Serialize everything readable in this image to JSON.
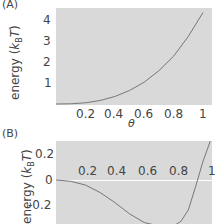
{
  "chart_data": [
    {
      "panel": "(A)",
      "type": "line",
      "xlabel": "θ",
      "ylabel": "energy (kBT)",
      "ylabel_parts": {
        "pre": "energy (",
        "k": "k",
        "sub": "B",
        "T": "T",
        "post": ")"
      },
      "xticks": [
        "0.2",
        "0.4",
        "0.6",
        "0.8",
        "1"
      ],
      "yticks": [
        "1",
        "2",
        "3",
        "4"
      ],
      "xlim": [
        0,
        1.05
      ],
      "ylim": [
        0,
        4.6
      ],
      "x": [
        0,
        0.1,
        0.2,
        0.3,
        0.4,
        0.5,
        0.6,
        0.7,
        0.8,
        0.9,
        1.0
      ],
      "y": [
        0,
        0.01,
        0.06,
        0.17,
        0.36,
        0.65,
        1.05,
        1.6,
        2.3,
        3.25,
        4.4
      ],
      "background": "#d9d9d9",
      "line_color": "#777777"
    },
    {
      "panel": "(B)",
      "type": "line",
      "xlabel": "",
      "ylabel": "energy (kBT)",
      "ylabel_parts": {
        "pre": "energy (",
        "k": "k",
        "sub": "B",
        "T": "T",
        "post": ")"
      },
      "xticks": [
        "0.2",
        "0.4",
        "0.6",
        "0.8",
        "1"
      ],
      "yticks": [
        "0.2",
        "0",
        "-0.2"
      ],
      "xlim": [
        0,
        1.05
      ],
      "ylim": [
        -0.35,
        0.32
      ],
      "x": [
        0,
        0.1,
        0.2,
        0.3,
        0.4,
        0.5,
        0.6,
        0.7,
        0.8,
        0.85,
        0.9,
        0.95,
        1.0,
        1.05
      ],
      "y": [
        0,
        -0.01,
        -0.04,
        -0.1,
        -0.18,
        -0.27,
        -0.34,
        -0.38,
        -0.37,
        -0.33,
        -0.24,
        -0.05,
        0.15,
        0.32
      ],
      "background": "#d9d9d9",
      "line_color": "#777777",
      "zero_line_color": "#ffffff"
    }
  ]
}
